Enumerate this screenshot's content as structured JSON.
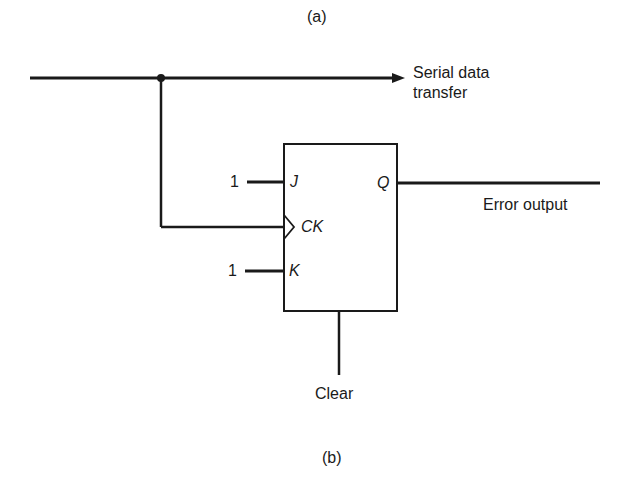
{
  "figure": {
    "caption_top": "(a)",
    "caption_bottom": "(b)"
  },
  "diagram": {
    "type": "JK flip-flop error detection circuit",
    "signals": {
      "serial_line_label_1": "Serial data",
      "serial_line_label_2": "transfer",
      "output_label": "Error output",
      "clear_label": "Clear"
    },
    "flip_flop": {
      "pins": {
        "j": "J",
        "k": "K",
        "ck": "CK",
        "q": "Q"
      },
      "inputs": {
        "j_value": "1",
        "k_value": "1"
      }
    },
    "colors": {
      "line": "#1a1a1a",
      "background": "#ffffff"
    }
  }
}
